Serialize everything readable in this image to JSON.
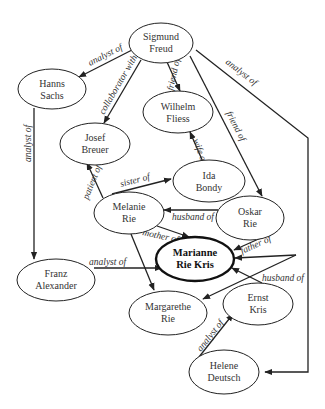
{
  "diagram": {
    "nodes": {
      "freud": {
        "line1": "Sigmund",
        "line2": "Freud"
      },
      "sachs": {
        "line1": "Hanns",
        "line2": "Sachs"
      },
      "fliess": {
        "line1": "Wilhelm",
        "line2": "Fliess"
      },
      "breuer": {
        "line1": "Josef",
        "line2": "Breuer"
      },
      "bondy": {
        "line1": "Ida",
        "line2": "Bondy"
      },
      "melanie": {
        "line1": "Melanie",
        "line2": "Rie"
      },
      "oskar": {
        "line1": "Oskar",
        "line2": "Rie"
      },
      "marianne": {
        "line1": "Marianne",
        "line2": "Rie Kris"
      },
      "franz": {
        "line1": "Franz",
        "line2": "Alexander"
      },
      "margarethe": {
        "line1": "Margarethe",
        "line2": "Rie"
      },
      "ernst": {
        "line1": "Ernst",
        "line2": "Kris"
      },
      "helene": {
        "line1": "Helene",
        "line2": "Deutsch"
      }
    },
    "edges": {
      "freud_sachs": "analyst of",
      "freud_breuer": "collaborator with",
      "freud_fliess": "friend of",
      "freud_oskar": "friend of",
      "freud_helene": "analyst of",
      "sachs_franz": "analyst of",
      "bondy_fliess": "wife of",
      "melanie_breuer": "patient of",
      "melanie_bondy": "sister of",
      "oskar_melanie": "husband of",
      "melanie_marianne": "mother of",
      "oskar_marianne": "father of",
      "franz_marianne": "analyst of",
      "ernst_marianne": "husband of",
      "helene_ernst": "analyst of"
    },
    "focal_node": "Marianne Rie Kris"
  }
}
